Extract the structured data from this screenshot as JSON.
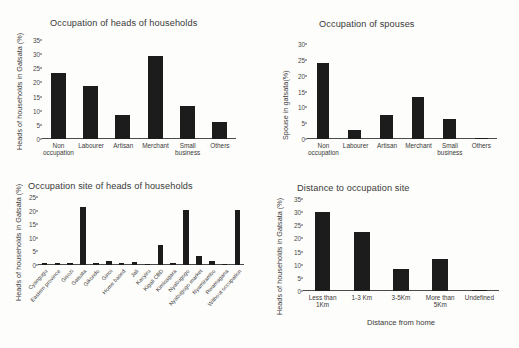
{
  "figure": {
    "background_color": "#fdfdfb",
    "bar_color": "#1c1c1c",
    "axis_color": "#4a4a4a"
  },
  "chart_data": [
    {
      "id": "occupation-heads-of-households",
      "type": "bar",
      "title": "Occupation of heads of households",
      "xlabel": "",
      "ylabel": "Heads of households in Gatsata (%)",
      "ylim": [
        0,
        35
      ],
      "yticks": [
        0,
        5,
        10,
        15,
        20,
        25,
        30,
        35
      ],
      "grid": false,
      "legend": "none",
      "categories": [
        "Non occupation",
        "Labourer",
        "Artisan",
        "Merchant",
        "Small business",
        "Others"
      ],
      "values": [
        23.2,
        18.6,
        8.4,
        29.4,
        11.5,
        6.0
      ]
    },
    {
      "id": "occupation-of-spouses",
      "type": "bar",
      "title": "Occupation of spouses",
      "xlabel": "",
      "ylabel": "Spouse in gatsata(%)",
      "ylim": [
        0,
        30
      ],
      "yticks": [
        0,
        5,
        10,
        15,
        20,
        25,
        30
      ],
      "grid": false,
      "legend": "none",
      "categories": [
        "Non occupation",
        "Labourer",
        "Artisan",
        "Merchant",
        "Small business",
        "Others"
      ],
      "values": [
        23.9,
        2.7,
        7.6,
        13.4,
        6.3,
        0.3
      ]
    },
    {
      "id": "occupation-site-of-heads-of-households",
      "type": "bar",
      "title": "Occupation site of heads of households",
      "xlabel": "",
      "ylabel": "Heads of households in Gatsata (%)",
      "ylim": [
        0,
        25
      ],
      "yticks": [
        0,
        5,
        10,
        15,
        20,
        25
      ],
      "grid": false,
      "legend": "none",
      "categories": [
        "Cyangugu",
        "Eastern province",
        "Gisozi",
        "Gatsata",
        "Gikondo",
        "Ginoi",
        "Home based",
        "Jali",
        "Kacyiru",
        "Kigali CBD",
        "Kimisagara",
        "Nyabugogo",
        "Nyabugogo market",
        "Nyamirambo",
        "Rwamagana",
        "Without occupation"
      ],
      "values": [
        0.7,
        0.7,
        0.7,
        21.5,
        0.7,
        1.4,
        0.7,
        1.1,
        0.5,
        7.2,
        0.6,
        20.3,
        3.4,
        1.3,
        0.4,
        20.1
      ]
    },
    {
      "id": "distance-to-occupation-site",
      "type": "bar",
      "title": "Distance to occupation site",
      "xlabel": "Distance from home",
      "ylabel": "Heads of households in Gatsata (%)",
      "ylim": [
        0,
        35
      ],
      "yticks": [
        0,
        5,
        10,
        15,
        20,
        25,
        30,
        35
      ],
      "grid": false,
      "legend": "none",
      "categories": [
        "Less than 1Km",
        "1-3 Km",
        "3-5Km",
        "More than 5Km",
        "Undefined"
      ],
      "values": [
        30.0,
        22.4,
        8.2,
        12.2,
        0.4
      ]
    }
  ]
}
